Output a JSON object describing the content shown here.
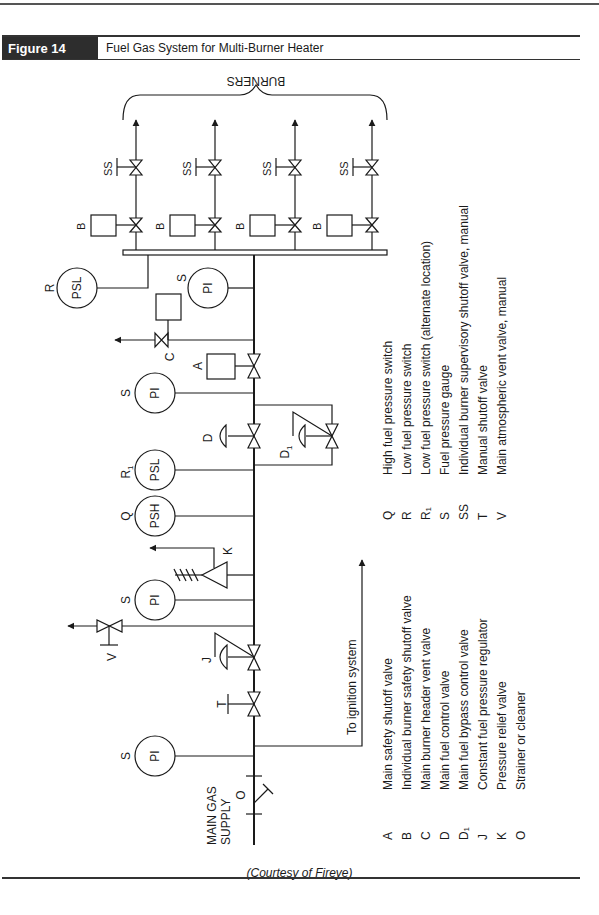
{
  "figure": {
    "number": "Figure 14",
    "title": "Fuel Gas System for Multi-Burner Heater",
    "courtesy": "(Courtesy of Fireye)"
  },
  "diagram": {
    "burners_label": "BURNERS",
    "main_supply_label": "MAIN GAS SUPPLY",
    "main_supply_line1": "MAIN GAS",
    "main_supply_line2": "SUPPLY",
    "ignition_label": "To ignition system",
    "instruments": {
      "pi": "PI",
      "psl": "PSL",
      "psh": "PSH"
    },
    "tags": {
      "A": "A",
      "B": "B",
      "C": "C",
      "D": "D",
      "D1": "D",
      "D1_sub": "1",
      "J": "J",
      "K": "K",
      "O": "O",
      "Q": "Q",
      "R": "R",
      "R1": "R",
      "R1_sub": "1",
      "S": "S",
      "SS": "SS",
      "T": "T",
      "V": "V"
    }
  },
  "legend": {
    "left": [
      {
        "code": "A",
        "desc": "Main safety shutoff valve"
      },
      {
        "code": "B",
        "desc": "Individual burner safety shutoff valve"
      },
      {
        "code": "C",
        "desc": "Main burner header vent valve"
      },
      {
        "code": "D",
        "desc": "Main fuel control valve"
      },
      {
        "code": "D₁",
        "desc": "Main fuel bypass control valve"
      },
      {
        "code": "J",
        "desc": "Constant fuel pressure regulator"
      },
      {
        "code": "K",
        "desc": "Pressure relief valve"
      },
      {
        "code": "O",
        "desc": "Strainer or cleaner"
      }
    ],
    "right": [
      {
        "code": "Q",
        "desc": "High fuel pressure switch"
      },
      {
        "code": "R",
        "desc": "Low fuel pressure switch"
      },
      {
        "code": "R₁",
        "desc": "Low fuel pressure switch (alternate location)"
      },
      {
        "code": "S",
        "desc": "Fuel pressure gauge"
      },
      {
        "code": "SS",
        "desc": "Individual burner supervisory shutoff valve, manual"
      },
      {
        "code": "T",
        "desc": "Manual shutoff valve"
      },
      {
        "code": "V",
        "desc": "Main atmospheric vent valve, manual"
      }
    ]
  }
}
